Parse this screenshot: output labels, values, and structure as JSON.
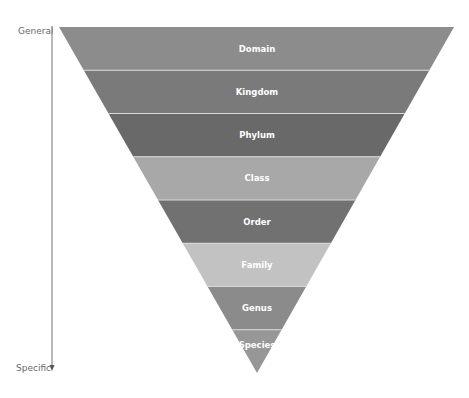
{
  "axis": {
    "top_label": "General",
    "bottom_label": "Specific",
    "color": "#888888"
  },
  "pyramid": {
    "levels": [
      {
        "label": "Domain",
        "color": "#8c8c8c"
      },
      {
        "label": "Kingdom",
        "color": "#7a7a7a"
      },
      {
        "label": "Phylum",
        "color": "#696969"
      },
      {
        "label": "Class",
        "color": "#a8a8a8"
      },
      {
        "label": "Order",
        "color": "#717171"
      },
      {
        "label": "Family",
        "color": "#c2c2c2"
      },
      {
        "label": "Genus",
        "color": "#8b8b8b"
      },
      {
        "label": "Species",
        "color": "#979797"
      }
    ],
    "separator_color": "#d9d9d9"
  }
}
